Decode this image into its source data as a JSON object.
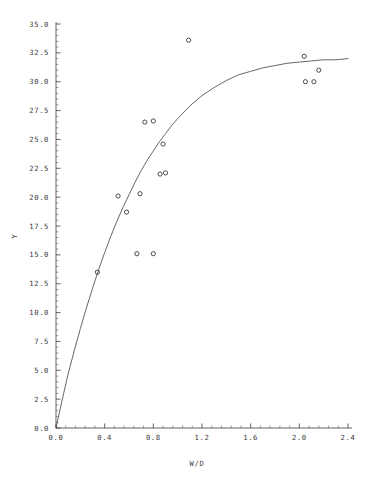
{
  "figure": {
    "background_color": "#ffffff",
    "foreground_color": "#2b2b2b",
    "curve_color": "#4a4a50",
    "marker_color": "#2e2e33"
  },
  "axes": {
    "x": {
      "title": "W/D",
      "min": 0.0,
      "max": 2.4,
      "tick_step": 0.4,
      "minor_ticks_per_major": 4,
      "tick_labels": [
        "0.0",
        "0.4",
        "0.8",
        "1.2",
        "1.6",
        "2.0",
        "2.4"
      ],
      "tick_values": [
        0.0,
        0.4,
        0.8,
        1.2,
        1.6,
        2.0,
        2.4
      ]
    },
    "y": {
      "title": "Y",
      "min": 0.0,
      "max": 35.0,
      "tick_step": 2.5,
      "minor_ticks_per_major": 4,
      "tick_labels": [
        "0.0",
        "2.5",
        "5.0",
        "7.5",
        "10.0",
        "12.5",
        "15.0",
        "17.5",
        "20.0",
        "22.5",
        "25.0",
        "27.5",
        "30.0",
        "32.5",
        "35.0"
      ],
      "tick_values": [
        0.0,
        2.5,
        5.0,
        7.5,
        10.0,
        12.5,
        15.0,
        17.5,
        20.0,
        22.5,
        25.0,
        27.5,
        30.0,
        32.5,
        35.0
      ]
    }
  },
  "chart_data": {
    "type": "scatter",
    "title": "",
    "xlabel": "W/D",
    "ylabel": "Y",
    "xlim": [
      0.0,
      2.4
    ],
    "ylim": [
      0.0,
      35.0
    ],
    "grid": false,
    "legend": false,
    "series": [
      {
        "name": "observations",
        "marker": "open-circle",
        "points": [
          [
            0.34,
            13.5
          ],
          [
            0.51,
            20.1
          ],
          [
            0.58,
            18.7
          ],
          [
            0.665,
            15.1
          ],
          [
            0.69,
            20.3
          ],
          [
            0.73,
            26.5
          ],
          [
            0.8,
            15.1
          ],
          [
            0.8,
            26.6
          ],
          [
            0.855,
            22.0
          ],
          [
            0.88,
            24.6
          ],
          [
            0.9,
            22.1
          ],
          [
            1.09,
            33.6
          ],
          [
            2.04,
            32.2
          ],
          [
            2.05,
            30.0
          ],
          [
            2.12,
            30.0
          ],
          [
            2.16,
            31.0
          ]
        ]
      },
      {
        "name": "fitted-curve",
        "marker": "line",
        "description": "monotone saturating fit through the origin",
        "points": [
          [
            0.0,
            0.0
          ],
          [
            0.05,
            2.4
          ],
          [
            0.1,
            4.7
          ],
          [
            0.15,
            6.7
          ],
          [
            0.2,
            8.6
          ],
          [
            0.25,
            10.4
          ],
          [
            0.3,
            12.1
          ],
          [
            0.35,
            13.7
          ],
          [
            0.4,
            15.2
          ],
          [
            0.45,
            16.6
          ],
          [
            0.5,
            17.9
          ],
          [
            0.55,
            19.1
          ],
          [
            0.6,
            20.2
          ],
          [
            0.65,
            21.3
          ],
          [
            0.7,
            22.3
          ],
          [
            0.75,
            23.2
          ],
          [
            0.8,
            24.0
          ],
          [
            0.85,
            24.8
          ],
          [
            0.9,
            25.5
          ],
          [
            0.95,
            26.2
          ],
          [
            1.0,
            26.8
          ],
          [
            1.1,
            27.9
          ],
          [
            1.2,
            28.8
          ],
          [
            1.3,
            29.5
          ],
          [
            1.4,
            30.1
          ],
          [
            1.5,
            30.6
          ],
          [
            1.6,
            30.9
          ],
          [
            1.7,
            31.2
          ],
          [
            1.8,
            31.4
          ],
          [
            1.9,
            31.6
          ],
          [
            2.0,
            31.7
          ],
          [
            2.1,
            31.8
          ],
          [
            2.2,
            31.9
          ],
          [
            2.3,
            31.9
          ],
          [
            2.4,
            32.0
          ]
        ]
      }
    ]
  }
}
